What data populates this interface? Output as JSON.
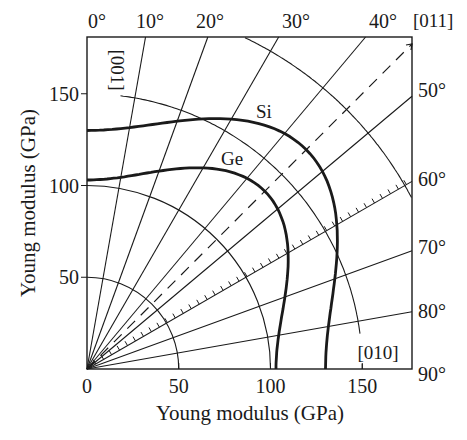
{
  "chart_data": {
    "type": "polar-line",
    "title": "",
    "xlabel": "Young modulus (GPa)",
    "ylabel": "Young modulus (GPa)",
    "xlim": [
      0,
      177
    ],
    "ylim": [
      0,
      181
    ],
    "x_ticks": [
      0,
      50,
      100,
      150
    ],
    "y_ticks": [
      50,
      100,
      150
    ],
    "grid": true,
    "angle_reference": "angle measured from [001] (y-axis, 0°) toward [010] (x-axis, 90°)",
    "angle_labels_top": [
      "0°",
      "10°",
      "20°",
      "30°",
      "40°"
    ],
    "angle_labels_right": [
      "50°",
      "60°",
      "70°",
      "80°",
      "90°"
    ],
    "radial_lines_deg": [
      10,
      20,
      30,
      40,
      50,
      60,
      70,
      80
    ],
    "dashed_line": {
      "angle_deg": 45,
      "label": "[011]"
    },
    "hatched_line": {
      "angle_deg": 60
    },
    "arcs_gpa": [
      50,
      100,
      150
    ],
    "direction_labels": {
      "top": "[001]",
      "right": "[010]",
      "diagonal": "[011]"
    },
    "series": [
      {
        "name": "Si",
        "angles_deg": [
          0,
          15,
          30,
          45,
          60,
          75,
          90
        ],
        "values": [
          130,
          138,
          157,
          169,
          157,
          138,
          130
        ]
      },
      {
        "name": "Ge",
        "angles_deg": [
          0,
          15,
          30,
          45,
          60,
          75,
          90
        ],
        "values": [
          103,
          110,
          126,
          137,
          126,
          110,
          103
        ]
      }
    ],
    "model": {
      "Si": {
        "E100": 130,
        "E110": 169
      },
      "Ge": {
        "E100": 103,
        "E110": 137
      }
    }
  },
  "labels": {
    "xlabel": "Young modulus (GPa)",
    "ylabel": "Young modulus (GPa)",
    "si": "Si",
    "ge": "Ge",
    "dir_001": "[001]",
    "dir_010": "[010]",
    "dir_011": "[011]"
  }
}
